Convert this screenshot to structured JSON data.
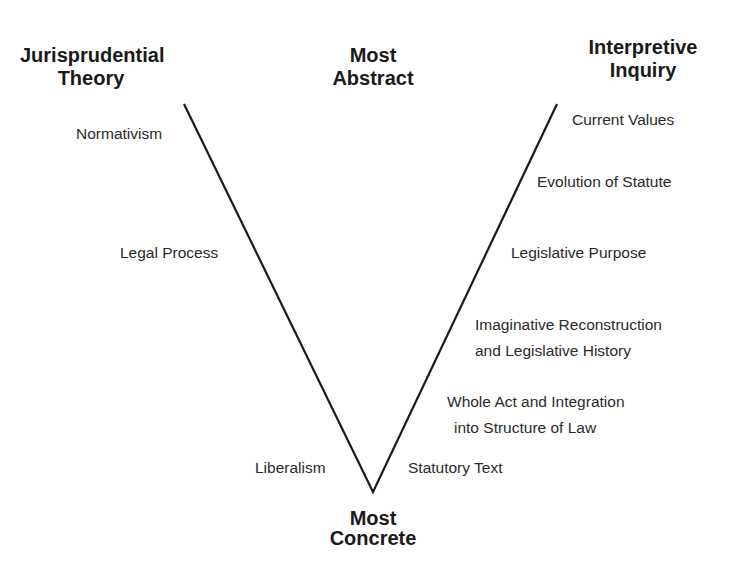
{
  "headers": {
    "left": [
      "Jurisprudential",
      "Theory"
    ],
    "center_top": [
      "Most",
      "Abstract"
    ],
    "right": [
      "Interpretive",
      "Inquiry"
    ],
    "bottom": [
      "Most",
      "Concrete"
    ]
  },
  "jurisprudential_theory": [
    {
      "label": "Normativism"
    },
    {
      "label": "Legal Process"
    },
    {
      "label": "Liberalism"
    }
  ],
  "interpretive_inquiry": [
    {
      "lines": [
        "Current Values"
      ]
    },
    {
      "lines": [
        "Evolution of Statute"
      ]
    },
    {
      "lines": [
        "Legislative Purpose"
      ]
    },
    {
      "lines": [
        "Imaginative Reconstruction",
        "and Legislative History"
      ]
    },
    {
      "lines": [
        "Whole Act and Integration",
        "into Structure of Law"
      ]
    },
    {
      "lines": [
        "Statutory Text"
      ]
    }
  ],
  "diagram": {
    "shape": "V",
    "left_top": [
      184,
      104
    ],
    "right_top": [
      557,
      104
    ],
    "vertex": [
      373,
      492
    ],
    "line_color": "#1a1a1a"
  }
}
